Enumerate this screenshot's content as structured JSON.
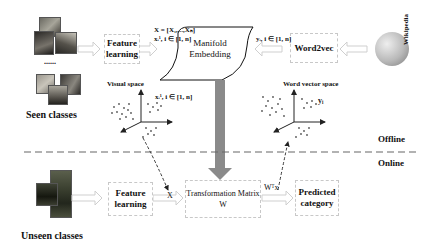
{
  "seen": {
    "label": "Seen classes",
    "ellipsis": "......"
  },
  "unseen": {
    "label": "Unseen classes"
  },
  "boxes": {
    "feature_learning_top": "Feature learning",
    "feature_learning_bottom": "Feature learning",
    "manifold_embedding": "Manifold Embedding",
    "word2vec": "Word2vec",
    "transformation_matrix": "Transformation Matrix W",
    "predicted_category": "Predicted category"
  },
  "wikipedia": {
    "label": "Wikipedia"
  },
  "math": {
    "X_set": "X = [X₁,...,Xₙ]",
    "x_i_top": "xᵢ¹, i ∈ [1, n]",
    "y_i_top": "yᵢ, i ∈ [1, n]",
    "x_i_visual": "xᵢ¹, i ∈ [1, n]",
    "y_i_word": "yᵢ",
    "x_online": "X",
    "wtx": "Wᵀx"
  },
  "spaces": {
    "visual": "Visual space",
    "word": "Word vector space"
  },
  "phases": {
    "offline": "Offline",
    "online": "Online"
  },
  "colors": {
    "dashed_divider": "#666666",
    "thick_arrow": "#8a8a8a",
    "hollow_arrow": "#cfcfcf",
    "box_border": "#c8c8c8"
  }
}
